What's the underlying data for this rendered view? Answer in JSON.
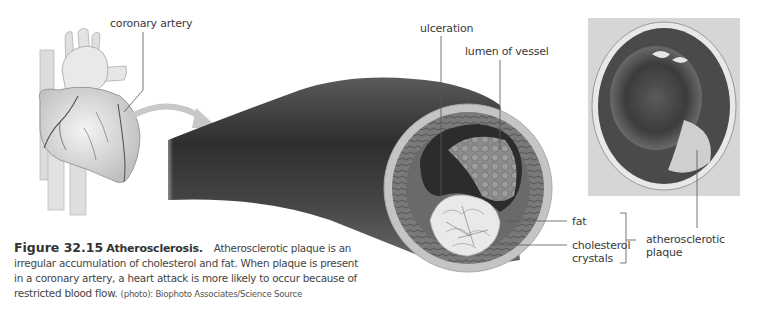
{
  "figure": {
    "number": "Figure 32.15",
    "title": "Atherosclerosis.",
    "caption_lines": [
      "Atherosclerotic plaque is an",
      "irregular accumulation of cholesterol and fat. When plaque is present",
      "in a coronary artery, a heart attack is more likely to occur because of",
      "restricted blood flow."
    ],
    "caption_text": "Atherosclerotic plaque is an irregular accumulation of cholesterol and fat. When plaque is present in a coronary artery, a heart attack is more likely to occur because of restricted blood flow.",
    "credit": "(photo): Biophoto Associates/Science Source"
  },
  "labels": {
    "coronary_artery": "coronary artery",
    "ulceration": "ulceration",
    "lumen_of_vessel": "lumen of vessel",
    "fat": "fat",
    "cholesterol_line1": "cholesterol",
    "cholesterol_line2": "crystals",
    "plaque_line1": "atherosclerotic",
    "plaque_line2": "plaque"
  },
  "colors": {
    "vessel_dark": "#3a3a3a",
    "vessel_wall": "#bdbdbd",
    "leader_line": "#555555",
    "arrow": "#c8c8c8"
  }
}
